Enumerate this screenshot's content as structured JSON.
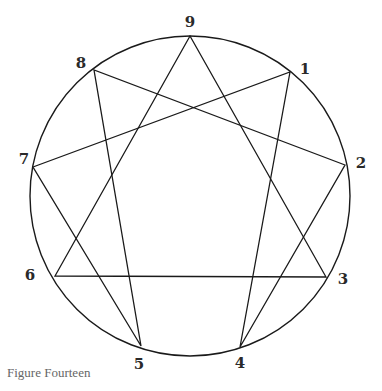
{
  "diagram": {
    "type": "enneagram",
    "circle": {
      "cx": 190,
      "cy": 196,
      "r": 160
    },
    "points": [
      {
        "id": "9",
        "x": 190,
        "y": 36,
        "lx": 190,
        "ly": 27
      },
      {
        "id": "1",
        "x": 290,
        "y": 72,
        "lx": 305,
        "ly": 74
      },
      {
        "id": "2",
        "x": 345,
        "y": 165,
        "lx": 361,
        "ly": 168
      },
      {
        "id": "3",
        "x": 326,
        "y": 277,
        "lx": 343,
        "ly": 284
      },
      {
        "id": "4",
        "x": 240,
        "y": 347,
        "lx": 240,
        "ly": 368
      },
      {
        "id": "5",
        "x": 141,
        "y": 346,
        "lx": 139,
        "ly": 369
      },
      {
        "id": "6",
        "x": 55,
        "y": 276,
        "lx": 30,
        "ly": 280
      },
      {
        "id": "7",
        "x": 33,
        "y": 167,
        "lx": 24,
        "ly": 164
      },
      {
        "id": "8",
        "x": 94,
        "y": 70,
        "lx": 81,
        "ly": 68
      }
    ],
    "triangle": [
      "9",
      "3",
      "6"
    ],
    "hexad": [
      "1",
      "4",
      "2",
      "8",
      "5",
      "7"
    ],
    "stroke_color": "#1a1a1a"
  },
  "caption": "Figure Fourteen"
}
